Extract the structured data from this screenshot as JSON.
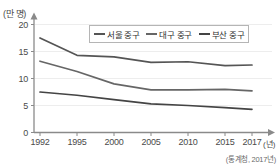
{
  "chart_data": {
    "type": "line",
    "title": "",
    "subtitle": "",
    "xlabel": "연도",
    "ylabel": "(만 명)",
    "y_unit_label": "(만 명)",
    "x_unit_label": "(년)",
    "source": "(통계청, 2017년)",
    "categories": [
      "1992",
      "1995",
      "2000",
      "2005",
      "2010",
      "2015",
      "2017"
    ],
    "x": [
      1992,
      1995,
      2000,
      2005,
      2010,
      2015,
      2017
    ],
    "xlim": [
      1992,
      2017
    ],
    "ylim": [
      0,
      20
    ],
    "y_ticks": [
      "0",
      "5",
      "10",
      "15",
      "20"
    ],
    "y_tick_values": [
      0,
      5,
      10,
      15,
      20
    ],
    "grid": false,
    "legend_position": "top-center",
    "series": [
      {
        "name": "서울 중구",
        "color": "#555555",
        "values": [
          17.5,
          14.3,
          14.0,
          13.0,
          13.1,
          12.4,
          12.5
        ]
      },
      {
        "name": "대구 중구",
        "color": "#666666",
        "values": [
          13.2,
          11.3,
          9.0,
          7.9,
          7.9,
          8.0,
          7.7
        ]
      },
      {
        "name": "부산 중구",
        "color": "#444444",
        "values": [
          7.5,
          6.9,
          6.1,
          5.3,
          5.0,
          4.6,
          4.3
        ]
      }
    ]
  },
  "axis": {
    "y_unit": "(만 명)",
    "x_unit": "(년)",
    "y_labels": [
      "20",
      "15",
      "10",
      "5",
      "0"
    ],
    "x_labels": [
      "1992",
      "1995",
      "2000",
      "2005",
      "2010",
      "2015",
      "2017"
    ]
  },
  "legend": {
    "items": [
      {
        "label": "서울 중구"
      },
      {
        "label": "대구 중구"
      },
      {
        "label": "부산 중구"
      }
    ]
  },
  "footer": {
    "source": "(통계청, 2017년)"
  },
  "colors": {
    "axis": "#8a8a8a",
    "line_seoul": "#555555",
    "line_daegu": "#666666",
    "line_busan": "#444444",
    "text": "#3a3a3a",
    "background": "#ffffff"
  }
}
